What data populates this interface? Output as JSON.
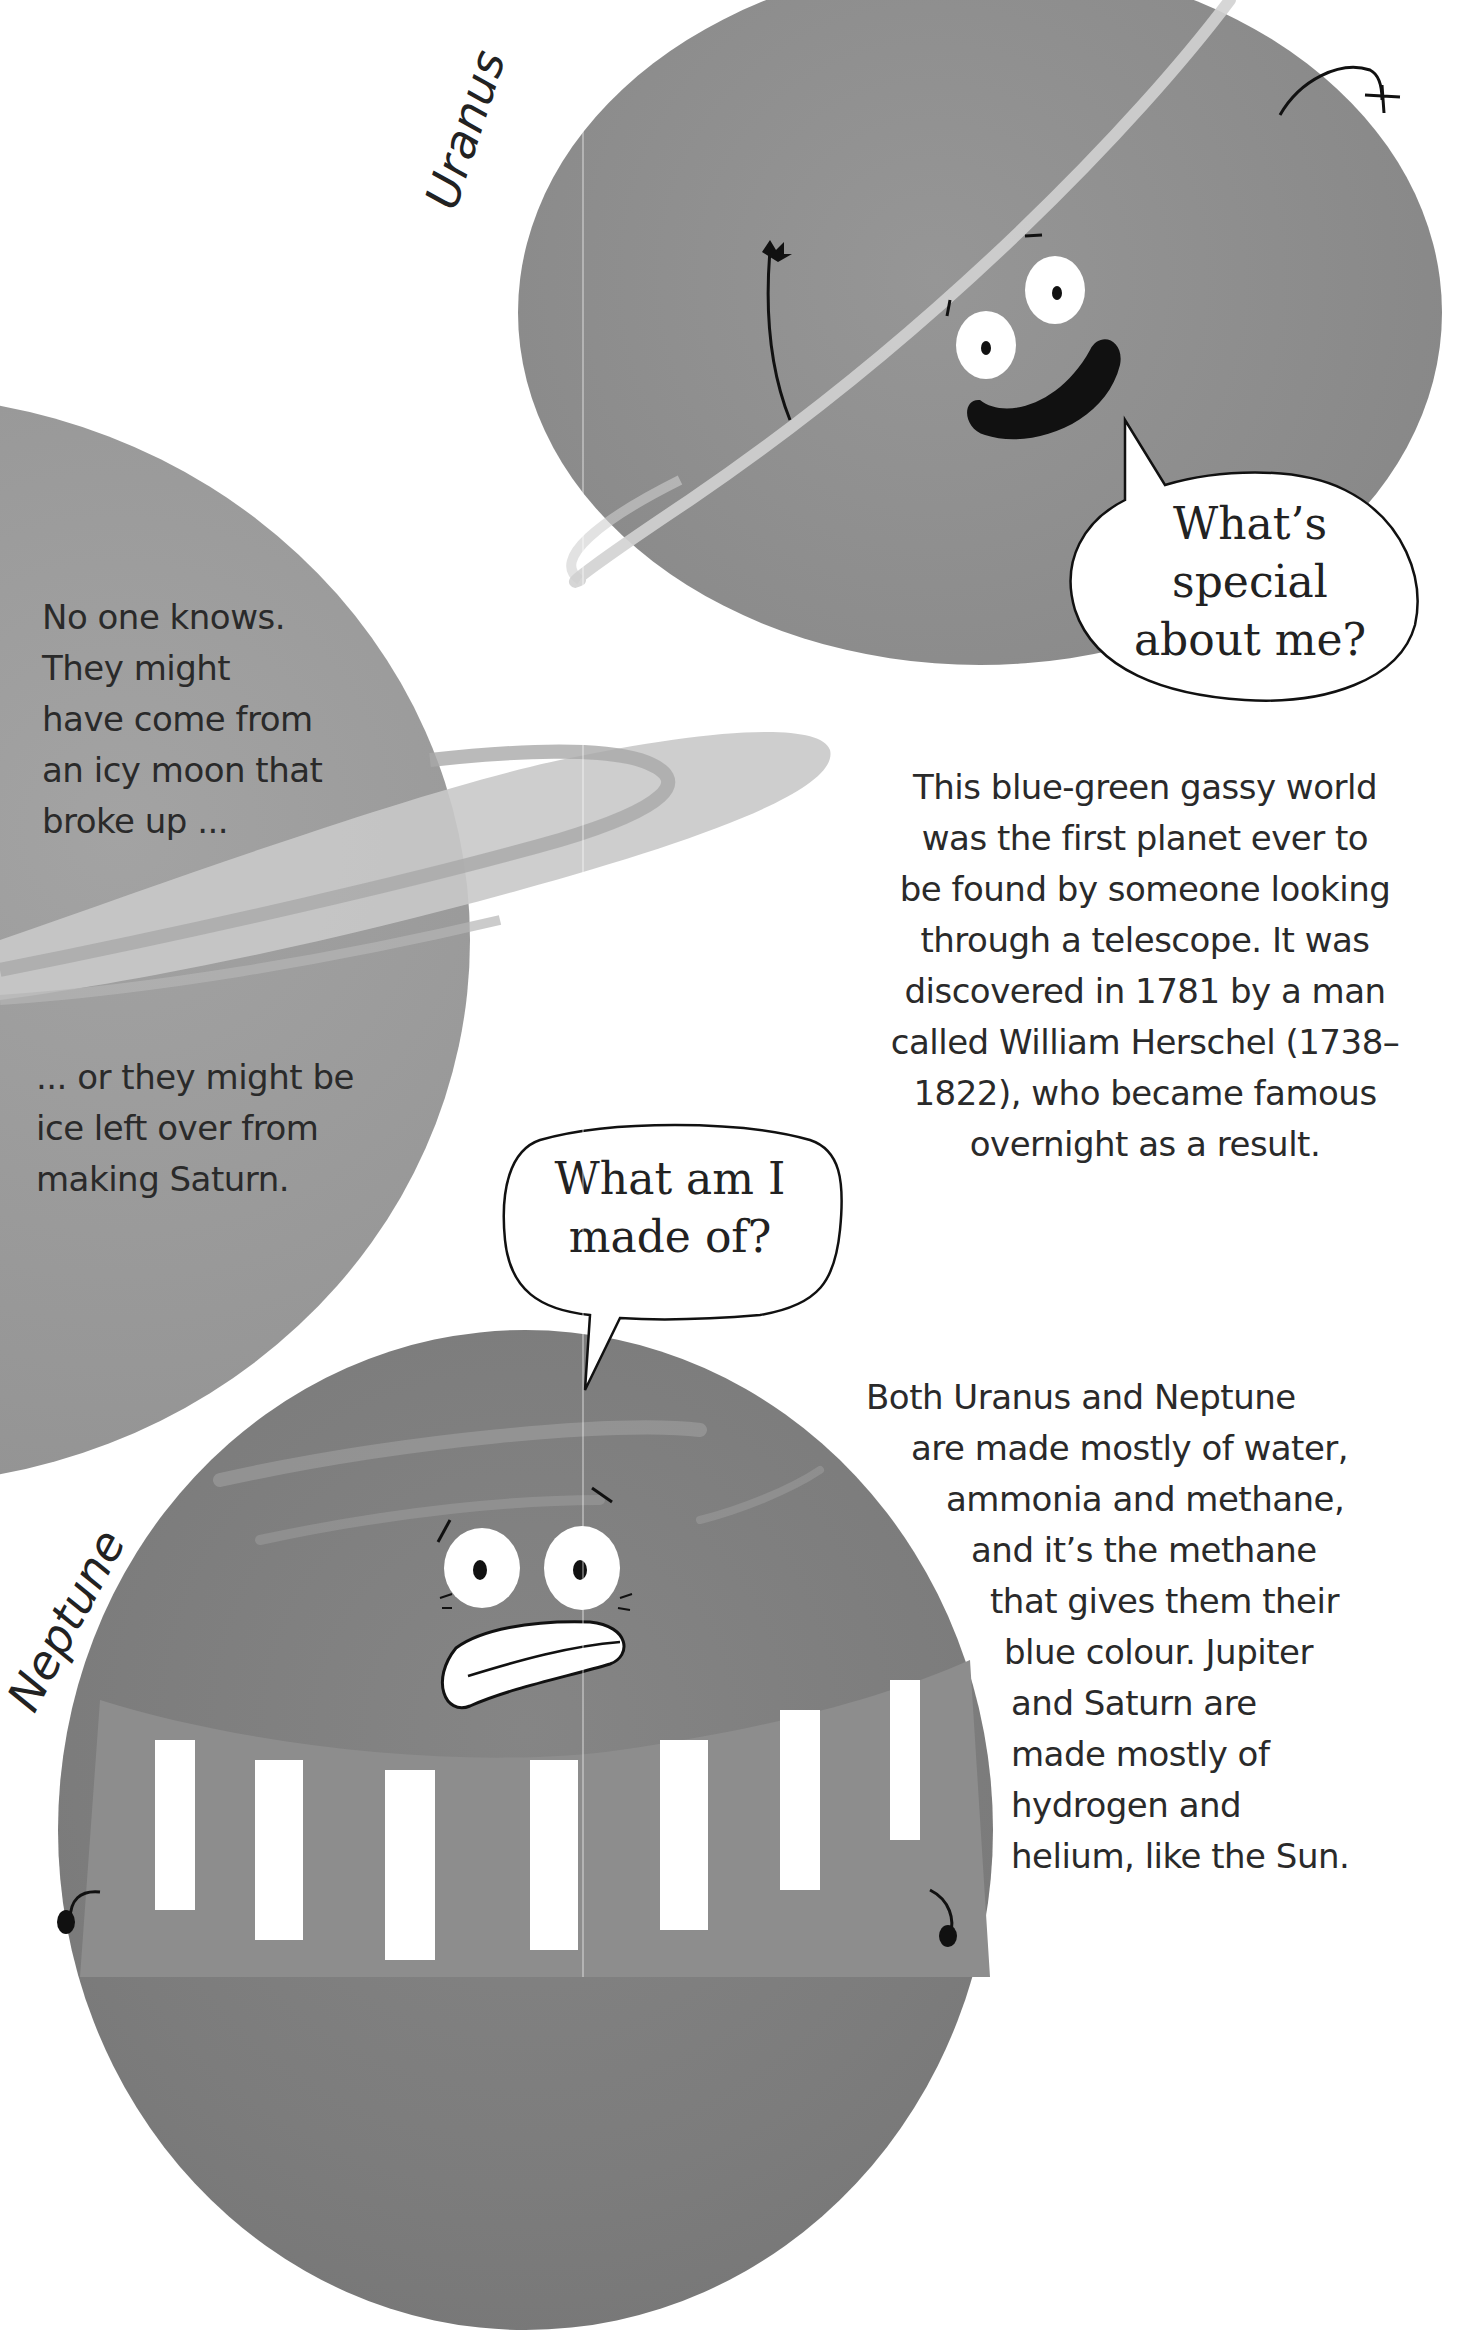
{
  "page": {
    "type": "illustrated book spread",
    "background": "#ffffff"
  },
  "planets": {
    "uranus": {
      "label": "Uranus",
      "fill": "#8f8f8f",
      "ring": "#c8c8c8"
    },
    "saturn": {
      "fill": "#9a9a9a",
      "ring": "#c3c3c3"
    },
    "neptune": {
      "label": "Neptune",
      "fill": "#7f7f7f",
      "scarf_stripe": "#ffffff"
    }
  },
  "speech_bubbles": {
    "uranus": {
      "lines": [
        "What’s",
        "special",
        "about me?"
      ]
    },
    "neptune": {
      "lines": [
        "What am I",
        "made of?"
      ]
    }
  },
  "text_blocks": {
    "saturn_ring_origin_1": {
      "lines": [
        "No one knows.",
        "They might",
        "have come from",
        "an icy moon that",
        "broke up ..."
      ]
    },
    "saturn_ring_origin_2": {
      "lines": [
        "... or they might be",
        "ice left over from",
        "making Saturn."
      ]
    },
    "uranus_fact": {
      "lines": [
        "This blue-green gassy world",
        "was the first planet ever to",
        "be found by someone looking",
        "through a telescope. It was",
        "discovered in 1781 by a man",
        "called William Herschel (1738–",
        "1822), who became famous",
        "overnight as a result."
      ]
    },
    "composition_fact": {
      "lines": [
        "Both Uranus and Neptune",
        "are made mostly of water,",
        "ammonia and methane,",
        "and it’s the methane",
        "that gives them their",
        "blue colour. Jupiter",
        "and Saturn are",
        "made mostly of",
        "hydrogen and",
        "helium, like the Sun."
      ]
    }
  }
}
